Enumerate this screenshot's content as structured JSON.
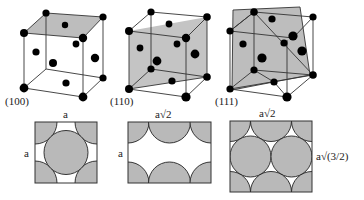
{
  "figure": {
    "colors": {
      "plane": "#bdbdbd",
      "atom": "#000000",
      "edge": "#333333",
      "circle_fill": "#b9b9b9"
    },
    "cells": [
      {
        "label": "(100)"
      },
      {
        "label": "(110)"
      },
      {
        "label": "(111)"
      }
    ],
    "planes": [
      {
        "top_label": "a",
        "side_label": "a"
      },
      {
        "top_label": "a√2",
        "side_label": "a"
      },
      {
        "top_label": "a√2",
        "side_label": "a√(3/2)"
      }
    ]
  }
}
